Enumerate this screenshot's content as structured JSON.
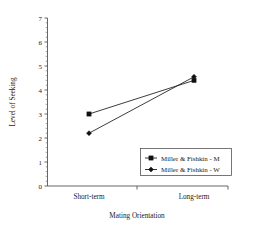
{
  "chart_data": {
    "type": "line",
    "title": "",
    "xlabel": "Mating Orientation",
    "ylabel": "Level of Seeking",
    "categories": [
      "Short-term",
      "Long-term"
    ],
    "ylim": [
      0,
      7
    ],
    "yticks": [
      0,
      1,
      2,
      3,
      4,
      5,
      6,
      7
    ],
    "ytick_labels": [
      "0",
      "1",
      "2",
      "3",
      "4",
      "5",
      "6",
      "7"
    ],
    "grid": false,
    "legend_position": "lower-right",
    "series": [
      {
        "name": "Miller & Fishkin - M",
        "marker": "square",
        "color": "#111111",
        "values": [
          3.0,
          4.4
        ]
      },
      {
        "name": "Miller & Fishkin - W",
        "marker": "diamond",
        "color": "#111111",
        "values": [
          2.2,
          4.55
        ]
      }
    ]
  },
  "axes": {
    "y_label": "Level of Seeking",
    "x_label": "Mating Orientation",
    "y_ticks": [
      "7",
      "6",
      "5",
      "4",
      "3",
      "2",
      "1",
      "0"
    ],
    "x_ticks": [
      "Short-term",
      "Long-term"
    ]
  },
  "legend": {
    "entries": [
      {
        "label": "Miller & Fishkin - M"
      },
      {
        "label": "Miller & Fishkin - W"
      }
    ]
  }
}
